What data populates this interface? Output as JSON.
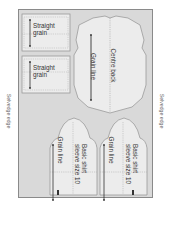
{
  "diagram": {
    "selvedge_left": "Selvedge edge",
    "selvedge_right": "Selvedge edge",
    "pieces": [
      {
        "id": "strip-1",
        "label_line1": "Straight",
        "label_line2": "grain"
      },
      {
        "id": "strip-2",
        "label_line1": "Straight",
        "label_line2": "grain"
      },
      {
        "id": "back",
        "label_centre": "Centre back",
        "label_grain": "Grain line"
      },
      {
        "id": "sleeve-1",
        "label_line1": "Basic shirt",
        "label_line2": "sleeve size 10",
        "label_grain": "Grain line"
      },
      {
        "id": "sleeve-2",
        "label_line1": "Basic shirt",
        "label_line2": "sleeve size 10",
        "label_grain": "Grain line"
      }
    ]
  },
  "colors": {
    "fabric": "#d9d9d9",
    "piece_fill": "#ececec",
    "outline": "#8a8a8a",
    "text": "#333333",
    "selvedge_text": "#666666"
  }
}
